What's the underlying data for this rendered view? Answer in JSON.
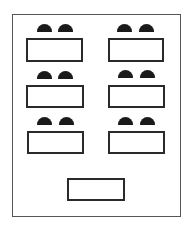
{
  "diagram": {
    "type": "classroom-seating-layout",
    "colors": {
      "room_border": "#555555",
      "desk_border": "#2a2a2a",
      "chair_fill": "#1a1a1a",
      "background": "#ffffff"
    },
    "student_desks": [
      {
        "row": 1,
        "column": "left",
        "chairs": 2
      },
      {
        "row": 1,
        "column": "right",
        "chairs": 2
      },
      {
        "row": 2,
        "column": "left",
        "chairs": 2
      },
      {
        "row": 2,
        "column": "right",
        "chairs": 2
      },
      {
        "row": 3,
        "column": "left",
        "chairs": 2
      },
      {
        "row": 3,
        "column": "right",
        "chairs": 2
      }
    ],
    "teacher_desk": {
      "chairs": 0
    },
    "counts": {
      "student_desks": 6,
      "student_chairs": 12,
      "teacher_desks": 1
    }
  }
}
